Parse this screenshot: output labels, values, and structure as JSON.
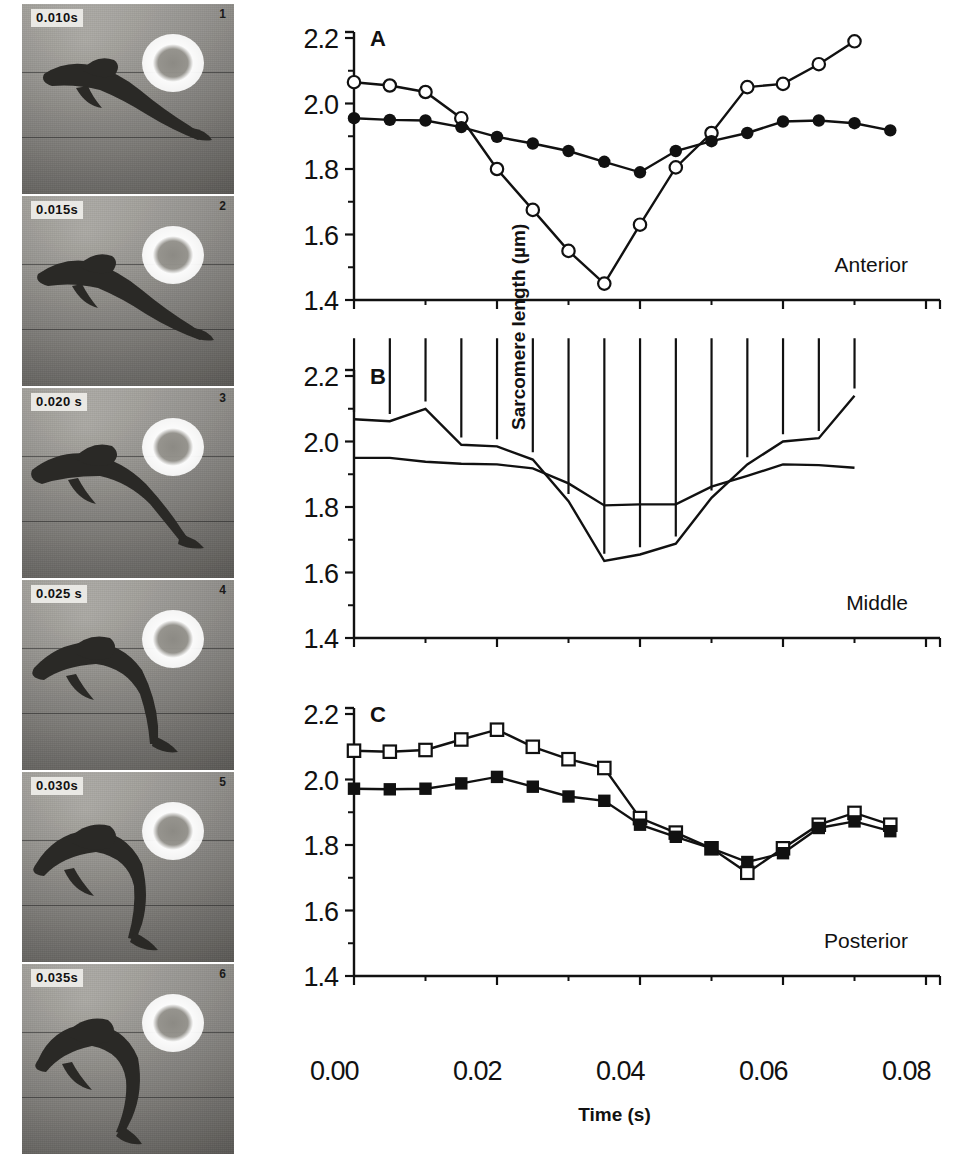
{
  "figure": {
    "yaxis_label": "Sarcomere length (µm)",
    "xaxis_label": "Time (s)",
    "xtick_labels": [
      "0.00",
      "0.02",
      "0.04",
      "0.06",
      "0.08"
    ],
    "ytick_labels": [
      "2.2",
      "2.0",
      "1.8",
      "1.6",
      "1.4"
    ]
  },
  "filmstrip": {
    "frames": [
      {
        "timestamp": "0.010s",
        "number": "1"
      },
      {
        "timestamp": "0.015s",
        "number": "2"
      },
      {
        "timestamp": "0.020 s",
        "number": "3"
      },
      {
        "timestamp": "0.025 s",
        "number": "4"
      },
      {
        "timestamp": "0.030s",
        "number": "5"
      },
      {
        "timestamp": "0.035s",
        "number": "6"
      }
    ]
  },
  "panels": [
    {
      "letter": "A",
      "region_label": "Anterior"
    },
    {
      "letter": "B",
      "region_label": "Middle"
    },
    {
      "letter": "C",
      "region_label": "Posterior"
    }
  ],
  "chart_data": [
    {
      "type": "line",
      "panel": "A",
      "title": "Anterior",
      "xlabel": "Time (s)",
      "ylabel": "Sarcomere length (µm)",
      "xlim": [
        0.0,
        0.08
      ],
      "ylim": [
        1.4,
        2.2
      ],
      "xticks": [
        0.0,
        0.02,
        0.04,
        0.06,
        0.08
      ],
      "yticks": [
        1.4,
        1.6,
        1.8,
        2.0,
        2.2
      ],
      "minor_ytick_step": 0.1,
      "grid": false,
      "legend": "none",
      "x": [
        0.0,
        0.005,
        0.01,
        0.015,
        0.02,
        0.025,
        0.03,
        0.035,
        0.04,
        0.045,
        0.05,
        0.055,
        0.06,
        0.065,
        0.07
      ],
      "series": [
        {
          "name": "open circles",
          "marker": "open-circle",
          "values": [
            2.065,
            2.055,
            2.035,
            1.955,
            1.8,
            1.675,
            1.55,
            1.45,
            1.63,
            1.805,
            1.91,
            2.05,
            2.06,
            2.12,
            2.19
          ]
        },
        {
          "name": "filled circles",
          "marker": "filled-circle",
          "values": [
            1.955,
            1.95,
            1.948,
            1.928,
            1.898,
            1.878,
            1.855,
            1.822,
            1.79,
            1.855,
            1.885,
            1.91,
            1.945,
            1.948,
            1.94,
            1.918
          ]
        }
      ]
    },
    {
      "type": "line",
      "panel": "B",
      "title": "Middle",
      "xlabel": "Time (s)",
      "ylabel": "Sarcomere length (µm)",
      "xlim": [
        0.0,
        0.08
      ],
      "ylim": [
        1.4,
        2.2
      ],
      "xticks": [
        0.0,
        0.02,
        0.04,
        0.06,
        0.08
      ],
      "yticks": [
        1.4,
        1.6,
        1.8,
        2.0,
        2.2
      ],
      "minor_ytick_step": 0.1,
      "grid": false,
      "legend": "none",
      "x": [
        0.0,
        0.005,
        0.01,
        0.015,
        0.02,
        0.025,
        0.03,
        0.035,
        0.04,
        0.045,
        0.05,
        0.055,
        0.06,
        0.065,
        0.07
      ],
      "series": [
        {
          "name": "open triangles",
          "marker": "open-triangle",
          "values": [
            2.068,
            2.062,
            2.1,
            1.99,
            1.985,
            1.945,
            1.818,
            1.635,
            1.655,
            1.688,
            1.828,
            1.93,
            2.0,
            2.01,
            2.14
          ]
        },
        {
          "name": "filled triangles",
          "marker": "filled-triangle",
          "values": [
            1.95,
            1.95,
            1.938,
            1.932,
            1.93,
            1.918,
            1.872,
            1.805,
            1.808,
            1.808,
            1.862,
            1.895,
            1.93,
            1.928,
            1.92
          ]
        }
      ]
    },
    {
      "type": "line",
      "panel": "C",
      "title": "Posterior",
      "xlabel": "Time (s)",
      "ylabel": "Sarcomere length (µm)",
      "xlim": [
        0.0,
        0.08
      ],
      "ylim": [
        1.4,
        2.2
      ],
      "xticks": [
        0.0,
        0.02,
        0.04,
        0.06,
        0.08
      ],
      "yticks": [
        1.4,
        1.6,
        1.8,
        2.0,
        2.2
      ],
      "minor_ytick_step": 0.1,
      "grid": false,
      "legend": "none",
      "x": [
        0.0,
        0.005,
        0.01,
        0.015,
        0.02,
        0.025,
        0.03,
        0.035,
        0.04,
        0.045,
        0.05,
        0.055,
        0.06,
        0.065,
        0.07
      ],
      "series": [
        {
          "name": "open squares",
          "marker": "open-square",
          "values": [
            2.088,
            2.085,
            2.09,
            2.122,
            2.152,
            2.1,
            2.062,
            2.035,
            1.882,
            1.838,
            1.79,
            1.715,
            1.79,
            1.862,
            1.898,
            1.862
          ]
        },
        {
          "name": "filled squares",
          "marker": "filled-square",
          "values": [
            1.972,
            1.97,
            1.972,
            1.988,
            2.008,
            1.978,
            1.948,
            1.935,
            1.862,
            1.825,
            1.79,
            1.748,
            1.775,
            1.852,
            1.872,
            1.842
          ]
        }
      ]
    }
  ]
}
